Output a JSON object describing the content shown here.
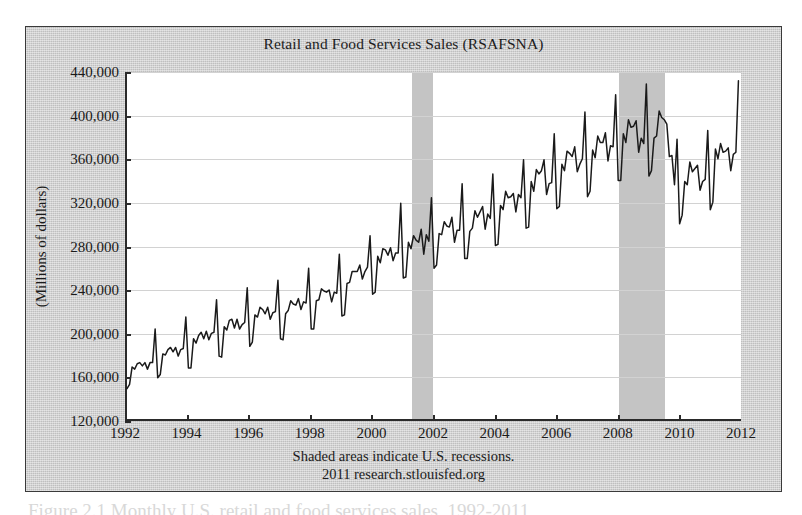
{
  "figure": {
    "title": "Retail and Food Services Sales (RSAFSNA)",
    "yaxis_title": "(Millions of dollars)",
    "footnote_line1": "Shaded areas indicate U.S. recessions.",
    "footnote_line2": "2011 research.stlouisfed.org",
    "page_caption": "Figure 2.1  Monthly U.S. retail and food services sales, 1992-2011"
  },
  "colors": {
    "figure_background": "#cfcfcf",
    "plot_background": "#ffffff",
    "series_line": "#1a1a1a",
    "recession_band": "#c4c4c4",
    "gridline": "#d2d2d2",
    "axis": "#2a2a2a",
    "text": "#1a1a1a"
  },
  "chart_data": {
    "type": "line",
    "title": "Retail and Food Services Sales (RSAFSNA)",
    "xlabel": "",
    "ylabel": "(Millions of dollars)",
    "units": "Millions of dollars",
    "frequency": "monthly",
    "xlim": [
      1992.0,
      2012.0
    ],
    "ylim": [
      120000,
      440000
    ],
    "yticks": [
      120000,
      160000,
      200000,
      240000,
      280000,
      320000,
      360000,
      400000,
      440000
    ],
    "ytick_labels": [
      "120,000",
      "160,000",
      "200,000",
      "240,000",
      "280,000",
      "320,000",
      "360,000",
      "400,000",
      "440,000"
    ],
    "xticks": [
      1992,
      1994,
      1996,
      1998,
      2000,
      2002,
      2004,
      2006,
      2008,
      2010,
      2012
    ],
    "xtick_labels": [
      "1992",
      "1994",
      "1996",
      "1998",
      "2000",
      "2002",
      "2004",
      "2006",
      "2008",
      "2010",
      "2012"
    ],
    "grid": true,
    "legend": "none",
    "annotations": [
      "Shaded areas indicate U.S. recessions.",
      "2011 research.stlouisfed.org"
    ],
    "shaded_regions": [
      {
        "label": "2001 recession",
        "start": 2001.25,
        "end": 2001.92
      },
      {
        "label": "2007-2009 recession",
        "start": 2007.98,
        "end": 2009.48
      }
    ],
    "series": [
      {
        "name": "Retail and Food Services Sales (RSAFSNA)",
        "x_start": 1992.0,
        "x_step": 0.0833333,
        "values": [
          148000,
          152000,
          168000,
          166000,
          171000,
          172000,
          169000,
          172000,
          166000,
          172000,
          172000,
          203000,
          158000,
          161000,
          180000,
          179000,
          184000,
          186000,
          182000,
          186000,
          178000,
          184000,
          185000,
          214000,
          167000,
          167000,
          194000,
          190000,
          197000,
          200000,
          194000,
          201000,
          193000,
          199000,
          200000,
          230000,
          178000,
          177000,
          205000,
          202000,
          211000,
          212000,
          204000,
          212000,
          203000,
          207000,
          209000,
          241000,
          187000,
          191000,
          216000,
          214000,
          223000,
          221000,
          217000,
          223000,
          212000,
          218000,
          219000,
          248000,
          194000,
          193000,
          217000,
          220000,
          229000,
          226000,
          225000,
          231000,
          221000,
          228000,
          227000,
          259000,
          203000,
          203000,
          229000,
          230000,
          240000,
          238000,
          237000,
          239000,
          228000,
          237000,
          236000,
          272000,
          215000,
          216000,
          245000,
          246000,
          256000,
          256000,
          256000,
          262000,
          249000,
          256000,
          260000,
          289000,
          235000,
          237000,
          270000,
          264000,
          277000,
          276000,
          271000,
          278000,
          266000,
          273000,
          273000,
          319000,
          250000,
          251000,
          283000,
          277000,
          289000,
          285000,
          283000,
          295000,
          272000,
          290000,
          284000,
          324000,
          259000,
          262000,
          291000,
          290000,
          302000,
          298000,
          297000,
          306000,
          283000,
          294000,
          294000,
          337000,
          268000,
          268000,
          293000,
          296000,
          312000,
          306000,
          311000,
          316000,
          295000,
          309000,
          305000,
          346000,
          280000,
          281000,
          317000,
          313000,
          330000,
          324000,
          325000,
          328000,
          311000,
          327000,
          324000,
          359000,
          296000,
          297000,
          339000,
          330000,
          350000,
          346000,
          349000,
          359000,
          327000,
          337000,
          338000,
          383000,
          314000,
          316000,
          355000,
          349000,
          367000,
          365000,
          362000,
          371000,
          348000,
          355000,
          360000,
          403000,
          325000,
          330000,
          368000,
          361000,
          381000,
          375000,
          375000,
          384000,
          358000,
          372000,
          371000,
          419000,
          340000,
          340000,
          383000,
          375000,
          396000,
          389000,
          390000,
          395000,
          366000,
          379000,
          374000,
          429000,
          344000,
          349000,
          379000,
          381000,
          404000,
          398000,
          396000,
          392000,
          362000,
          363000,
          336000,
          378000,
          300000,
          308000,
          339000,
          336000,
          357000,
          348000,
          351000,
          354000,
          331000,
          339000,
          341000,
          386000,
          313000,
          320000,
          369000,
          360000,
          374000,
          366000,
          367000,
          370000,
          349000,
          364000,
          366000,
          432000
        ]
      }
    ]
  }
}
